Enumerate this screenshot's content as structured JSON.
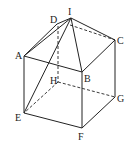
{
  "diagram": {
    "type": "cube-with-pyramid",
    "vertices": {
      "A": [
        24,
        56
      ],
      "B": [
        82,
        72
      ],
      "C": [
        115,
        40
      ],
      "D": [
        57,
        24
      ],
      "E": [
        24,
        113
      ],
      "F": [
        82,
        128
      ],
      "G": [
        115,
        97
      ],
      "H": [
        57,
        82
      ],
      "I": [
        71,
        18
      ]
    },
    "labels": {
      "A": "A",
      "B": "B",
      "C": "C",
      "D": "D",
      "E": "E",
      "F": "F",
      "G": "G",
      "H": "H",
      "I": "I"
    },
    "solid_edges": [
      [
        "A",
        "B"
      ],
      [
        "B",
        "C"
      ],
      [
        "A",
        "E"
      ],
      [
        "B",
        "F"
      ],
      [
        "C",
        "G"
      ],
      [
        "E",
        "F"
      ],
      [
        "F",
        "G"
      ],
      [
        "A",
        "D"
      ],
      [
        "A",
        "I"
      ],
      [
        "I",
        "B"
      ],
      [
        "I",
        "C"
      ],
      [
        "I",
        "E"
      ],
      [
        "D",
        "I"
      ]
    ],
    "dashed_edges": [
      [
        "D",
        "C"
      ],
      [
        "D",
        "H"
      ],
      [
        "H",
        "E"
      ],
      [
        "H",
        "G"
      ]
    ],
    "line_color": "#222222"
  }
}
